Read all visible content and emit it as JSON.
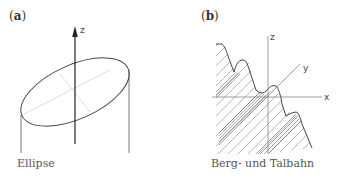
{
  "panels": [
    {
      "label": "(a)",
      "label_letter": "a",
      "caption": "Ellipse",
      "axes": {
        "z": "z"
      }
    },
    {
      "label": "(b)",
      "label_letter": "b",
      "caption": "Berg- und Talbahn",
      "axes": {
        "x": "x",
        "y": "y",
        "z": "z"
      }
    }
  ],
  "colors": {
    "line": "#444444",
    "light_line": "#cfcfcf",
    "hatch": "#888888"
  }
}
